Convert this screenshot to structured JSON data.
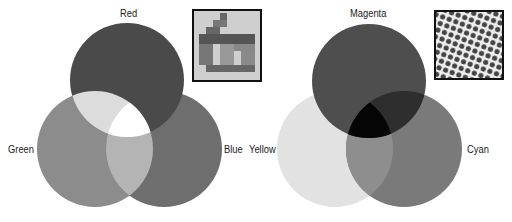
{
  "additive": {
    "labels": {
      "top": "Red",
      "left": "Green",
      "right": "Blue"
    },
    "colors": {
      "red": "#4a4a4a",
      "green": "#8c8c8c",
      "blue": "#6e6e6e",
      "red_green": "#dcdcdc",
      "green_blue": "#b4b4b4",
      "center": "#ffffff"
    },
    "inset": "pixel-grid-zoom"
  },
  "subtractive": {
    "labels": {
      "top": "Magenta",
      "left": "Yellow",
      "right": "Cyan"
    },
    "colors": {
      "magenta": "#4e4e4e",
      "yellow": "#e2e2e2",
      "cyan": "#7a7a7a",
      "center": "#050505"
    },
    "inset": "halftone-dot-zoom"
  }
}
